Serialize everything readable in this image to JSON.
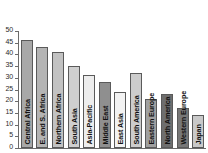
{
  "chart_data": {
    "type": "bar",
    "title": "",
    "subtitle": "",
    "xlabel": "",
    "ylabel": "",
    "ylim": [
      0,
      50
    ],
    "yticks": [
      0,
      5,
      10,
      15,
      20,
      25,
      30,
      35,
      40,
      45,
      50
    ],
    "grid": false,
    "legend": "none",
    "categories": [
      "Central Africa",
      "E. and S. Africa",
      "Northern Africa",
      "South Asia",
      "Asia-Pacific",
      "Middle East",
      "East Asia",
      "South America",
      "Eastern Europe",
      "North America",
      "Western Europe",
      "Japan"
    ],
    "values": [
      46,
      43,
      41,
      35,
      31,
      28,
      24,
      32,
      21,
      23,
      17,
      14
    ],
    "bar_colors": [
      "#a8a8a8",
      "#b4b4b4",
      "#c2c2c2",
      "#cfcfcf",
      "#ededed",
      "#8f8f8f",
      "#f2f2f2",
      "#cccccc",
      "#a0a0a0",
      "#6e6e6e",
      "#777777",
      "#c9c9c9"
    ],
    "axis_color": "#6b6b6b",
    "background": "#ffffff"
  }
}
